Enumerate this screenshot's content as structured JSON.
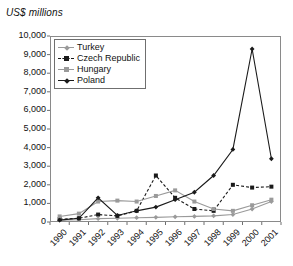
{
  "chart_data": {
    "type": "line",
    "title": "",
    "ylabel": "US$ millions",
    "xlabel": "",
    "ylim": [
      0,
      10000
    ],
    "ytick_step": 1000,
    "grid": false,
    "legend_position": "top-left inside plot",
    "categories": [
      "1990",
      "1991",
      "1992",
      "1993",
      "1994",
      "1995",
      "1996",
      "1997",
      "1998",
      "1999",
      "2000",
      "2001"
    ],
    "ytick_labels": [
      "10,000",
      "9,000",
      "8,000",
      "7,000",
      "6,000",
      "5,000",
      "4,000",
      "3,000",
      "2,000",
      "1,000",
      "0"
    ],
    "ytick_values": [
      10000,
      9000,
      8000,
      7000,
      6000,
      5000,
      4000,
      3000,
      2000,
      1000,
      0
    ],
    "series": [
      {
        "name": "Turkey",
        "color": "#9a9a9a",
        "marker": "diamond",
        "dash": "solid",
        "values": [
          100,
          120,
          180,
          200,
          230,
          250,
          280,
          300,
          330,
          400,
          700,
          1100
        ]
      },
      {
        "name": "Czech Republic",
        "color": "#1a1a1a",
        "marker": "square",
        "dash": "dashed",
        "values": [
          150,
          200,
          400,
          330,
          600,
          2500,
          1300,
          700,
          600,
          2000,
          1850,
          1900
        ]
      },
      {
        "name": "Hungary",
        "color": "#9a9a9a",
        "marker": "square",
        "dash": "solid",
        "values": [
          300,
          450,
          1100,
          1150,
          1100,
          1400,
          1700,
          1100,
          700,
          600,
          900,
          1200
        ]
      },
      {
        "name": "Poland",
        "color": "#1a1a1a",
        "marker": "diamond",
        "dash": "solid",
        "values": [
          100,
          200,
          1300,
          350,
          600,
          800,
          1200,
          1600,
          2500,
          3900,
          9300,
          3400
        ]
      }
    ]
  }
}
